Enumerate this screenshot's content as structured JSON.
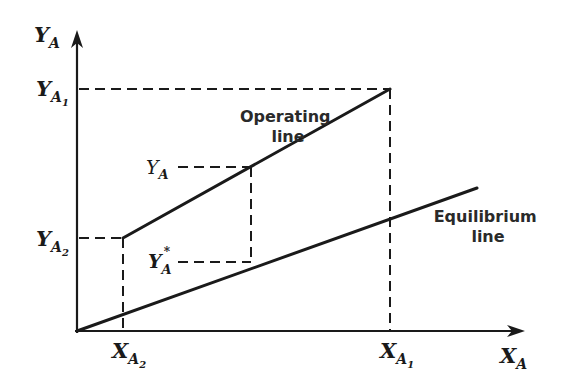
{
  "diagram": {
    "y_axis": {
      "label": "Y",
      "sub": "A"
    },
    "x_axis": {
      "label": "X",
      "sub": "A"
    },
    "y_ticks": {
      "ya1": {
        "main": "Y",
        "sub": "A",
        "subsub": "1"
      },
      "ya2": {
        "main": "Y",
        "sub": "A",
        "subsub": "2"
      }
    },
    "x_ticks": {
      "xa2": {
        "main": "X",
        "sub": "A",
        "subsub": "2"
      },
      "xa1": {
        "main": "X",
        "sub": "A",
        "subsub": "1"
      }
    },
    "annotations": {
      "ya": {
        "main": "Y",
        "sub": "A"
      },
      "ya_star": {
        "main": "Y",
        "sub": "A",
        "sup": "*"
      }
    },
    "lines": {
      "operating": {
        "label_line1": "Operating",
        "label_line2": "line"
      },
      "equilibrium": {
        "label_line1": "Equilibrium",
        "label_line2": "line"
      }
    },
    "colors": {
      "ink": "#1a1a1a",
      "background": "#ffffff"
    }
  }
}
